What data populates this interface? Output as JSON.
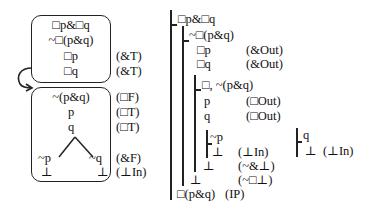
{
  "tree": {
    "top_box": {
      "lines": [
        "□p&□q",
        "~□(p&q)",
        "□p",
        "□q"
      ],
      "rules": [
        "",
        "",
        "(&T)",
        "(&T)"
      ]
    },
    "bottom_box": {
      "lines": [
        "~(p&q)",
        "p",
        "q"
      ],
      "rules": [
        "(□F)",
        "(□T)",
        "(□T)"
      ],
      "left_branch": [
        "~p",
        "⊥"
      ],
      "right_branch": [
        "~q",
        "⊥"
      ],
      "branch_rules": [
        "(&F)",
        "(⊥In)"
      ]
    }
  },
  "proof": {
    "lines": [
      {
        "text": "□p&□q",
        "rule": ""
      },
      {
        "text": "~□(p&q)",
        "rule": ""
      },
      {
        "text": "□p",
        "rule": "(&Out)"
      },
      {
        "text": "□q",
        "rule": "(&Out)"
      },
      {
        "text": "□, ~(p&q)",
        "rule": ""
      },
      {
        "text": "p",
        "rule": "(□Out)"
      },
      {
        "text": "q",
        "rule": "(□Out)"
      },
      {
        "text": "~p",
        "rule": ""
      },
      {
        "text": "⊥",
        "rule": "(⊥In)"
      },
      {
        "text": "⊥",
        "rule": "(~&⊥)"
      },
      {
        "text": "⊥",
        "rule": "(~□⊥)"
      },
      {
        "text": "□(p&q)",
        "rule": "(IP)"
      }
    ],
    "side": {
      "lines": [
        "q",
        "⊥"
      ],
      "rule": "(⊥In)"
    }
  }
}
